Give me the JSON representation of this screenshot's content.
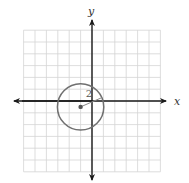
{
  "diagram": {
    "type": "coordinate-plane-circle",
    "axes": {
      "x_label": "x",
      "y_label": "y"
    },
    "grid": {
      "x_min": -6,
      "x_max": 6,
      "y_min": -6,
      "y_max": 6,
      "step": 1
    },
    "circle": {
      "center": [
        -1,
        -0.5
      ],
      "radius": 2,
      "radius_label": "2"
    },
    "colors": {
      "axis": "#1a1a1a",
      "grid": "#d4d4d4",
      "circle": "#707070",
      "radius": "#8a8a8a"
    }
  }
}
